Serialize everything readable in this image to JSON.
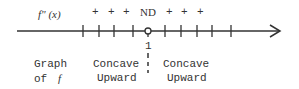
{
  "sign_chart": {
    "function_label": "f\" (x)",
    "signs_left": [
      "+",
      "+",
      "+"
    ],
    "critical_label": "ND",
    "signs_right": [
      "+",
      "+",
      "+"
    ],
    "critical_value": "1",
    "row_label_line1": "Graph",
    "row_label_line2": "of",
    "row_label_var": "f",
    "left_region": {
      "line1": "Concave",
      "line2": "Upward"
    },
    "right_region": {
      "line1": "Concave",
      "line2": "Upward"
    },
    "line_color": "#333333"
  }
}
